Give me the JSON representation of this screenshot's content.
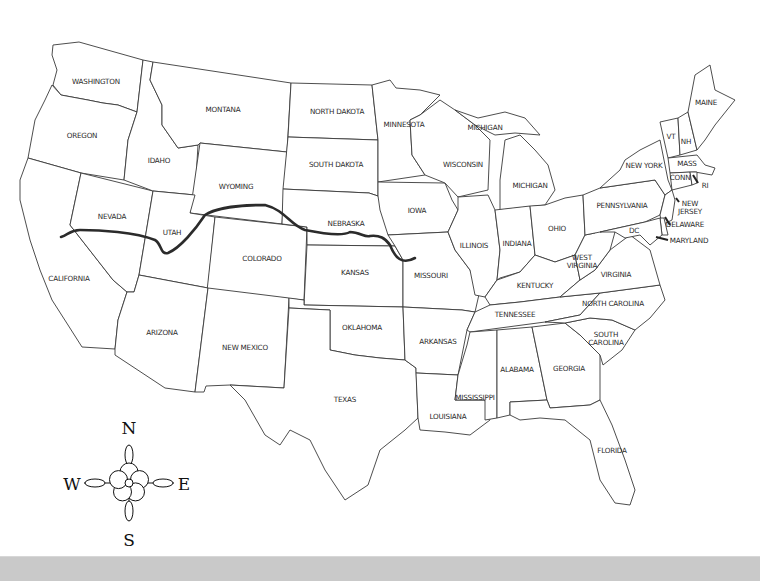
{
  "map": {
    "title": "United States outline map",
    "route_color": "#2b2b2b",
    "states": [
      {
        "name": "WASHINGTON",
        "x": 96,
        "y": 82
      },
      {
        "name": "OREGON",
        "x": 82,
        "y": 136
      },
      {
        "name": "CALIFORNIA",
        "x": 69,
        "y": 279
      },
      {
        "name": "NEVADA",
        "x": 112,
        "y": 217
      },
      {
        "name": "IDAHO",
        "x": 159,
        "y": 161
      },
      {
        "name": "MONTANA",
        "x": 223,
        "y": 110
      },
      {
        "name": "WYOMING",
        "x": 236,
        "y": 187
      },
      {
        "name": "UTAH",
        "x": 172,
        "y": 233
      },
      {
        "name": "ARIZONA",
        "x": 162,
        "y": 333
      },
      {
        "name": "COLORADO",
        "x": 262,
        "y": 259
      },
      {
        "name": "NEW MEXICO",
        "x": 245,
        "y": 348
      },
      {
        "name": "NORTH DAKOTA",
        "x": 337,
        "y": 112
      },
      {
        "name": "SOUTH DAKOTA",
        "x": 336,
        "y": 165
      },
      {
        "name": "NEBRASKA",
        "x": 346,
        "y": 224
      },
      {
        "name": "KANSAS",
        "x": 355,
        "y": 273
      },
      {
        "name": "OKLAHOMA",
        "x": 362,
        "y": 328
      },
      {
        "name": "TEXAS",
        "x": 345,
        "y": 400
      },
      {
        "name": "MINNESOTA",
        "x": 404,
        "y": 125
      },
      {
        "name": "IOWA",
        "x": 417,
        "y": 211
      },
      {
        "name": "MISSOURI",
        "x": 431,
        "y": 276
      },
      {
        "name": "ARKANSAS",
        "x": 438,
        "y": 342
      },
      {
        "name": "LOUISIANA",
        "x": 448,
        "y": 417
      },
      {
        "name": "WISCONSIN",
        "x": 463,
        "y": 165
      },
      {
        "name": "MICHIGAN",
        "x": 485,
        "y": 128
      },
      {
        "name": "MICHIGAN",
        "x": 530,
        "y": 186
      },
      {
        "name": "ILLINOIS",
        "x": 474,
        "y": 246
      },
      {
        "name": "INDIANA",
        "x": 517,
        "y": 244
      },
      {
        "name": "OHIO",
        "x": 557,
        "y": 229
      },
      {
        "name": "KENTUCKY",
        "x": 535,
        "y": 286
      },
      {
        "name": "TENNESSEE",
        "x": 515,
        "y": 315
      },
      {
        "name": "MISSISSIPPI",
        "x": 475,
        "y": 398
      },
      {
        "name": "ALABAMA",
        "x": 517,
        "y": 370
      },
      {
        "name": "GEORGIA",
        "x": 569,
        "y": 369
      },
      {
        "name": "FLORIDA",
        "x": 612,
        "y": 451
      },
      {
        "name": "SOUTH CAROLINA",
        "x": 606,
        "y": 339
      },
      {
        "name": "NORTH CAROLINA",
        "x": 613,
        "y": 304
      },
      {
        "name": "VIRGINIA",
        "x": 616,
        "y": 275
      },
      {
        "name": "WEST VIRGINIA",
        "x": 582,
        "y": 262
      },
      {
        "name": "PENNSYLVANIA",
        "x": 622,
        "y": 206
      },
      {
        "name": "NEW YORK",
        "x": 644,
        "y": 166
      },
      {
        "name": "VT",
        "x": 671,
        "y": 137
      },
      {
        "name": "NH",
        "x": 686,
        "y": 142
      },
      {
        "name": "MAINE",
        "x": 706,
        "y": 103
      },
      {
        "name": "MASS",
        "x": 687,
        "y": 164
      },
      {
        "name": "CONN",
        "x": 680,
        "y": 178
      },
      {
        "name": "RI",
        "x": 705,
        "y": 186
      },
      {
        "name": "NEW JERSEY",
        "x": 690,
        "y": 208
      },
      {
        "name": "DELAWARE",
        "x": 685,
        "y": 225
      },
      {
        "name": "MARYLAND",
        "x": 689,
        "y": 241
      },
      {
        "name": "DC",
        "x": 634,
        "y": 231
      }
    ]
  },
  "compass": {
    "north": "N",
    "south": "S",
    "east": "E",
    "west": "W"
  }
}
